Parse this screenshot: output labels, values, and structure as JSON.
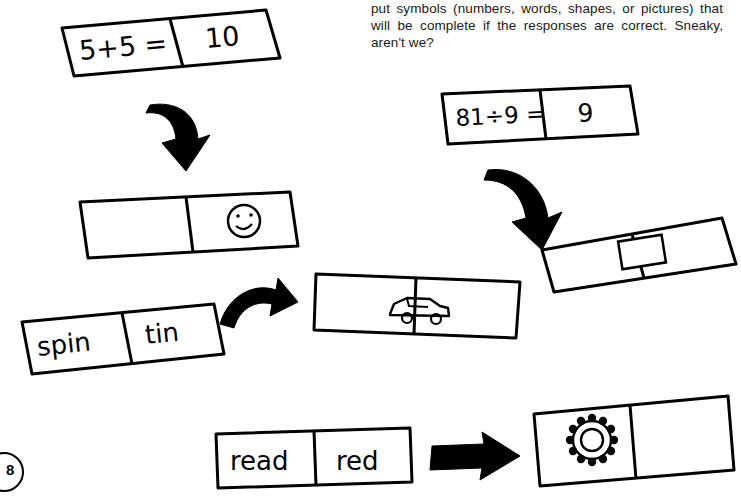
{
  "page": {
    "page_number": "8",
    "intro_paragraph": "put symbols (numbers, words, shapes, or pictures) that will be complete if the responses are correct. Sneaky, aren't we?"
  },
  "dominoes": [
    {
      "id": "domino-5plus5",
      "left_label": "5+5 =",
      "right_label": "10",
      "type": "text"
    },
    {
      "id": "domino-smiley-half",
      "left_label": "",
      "right_label": "",
      "type": "picture",
      "icon": "smiley-face-icon"
    },
    {
      "id": "domino-spin-tin",
      "left_label": "spin",
      "right_label": "tin",
      "type": "text"
    },
    {
      "id": "domino-car",
      "left_label": "",
      "right_label": "",
      "type": "picture",
      "icon": "car-icon"
    },
    {
      "id": "domino-81div9",
      "left_label": "81÷9 =",
      "right_label": "9",
      "type": "text"
    },
    {
      "id": "domino-rectangle",
      "left_label": "",
      "right_label": "",
      "type": "picture",
      "icon": "rectangle-shape-icon"
    },
    {
      "id": "domino-read-red",
      "left_label": "read",
      "right_label": "red",
      "type": "text"
    },
    {
      "id": "domino-flower",
      "left_label": "",
      "right_label": "",
      "type": "picture",
      "icon": "flower-gear-icon"
    }
  ],
  "arrows": [
    {
      "id": "arrow-down-left",
      "direction": "down"
    },
    {
      "id": "arrow-right-middle",
      "direction": "right"
    },
    {
      "id": "arrow-down-right",
      "direction": "down-right"
    },
    {
      "id": "arrow-right-bottom",
      "direction": "right"
    }
  ]
}
